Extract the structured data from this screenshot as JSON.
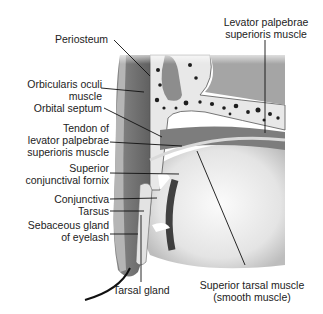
{
  "figure": {
    "labels": {
      "periosteum": "Periosteum",
      "orbicularis_1": "Orbicularis oculi",
      "orbicularis_2": "muscle",
      "orbital_septum": "Orbital septum",
      "tendon_1": "Tendon of",
      "tendon_2": "levator palpebrae",
      "tendon_3": "superioris muscle",
      "fornix_1": "Superior",
      "fornix_2": "conjunctival fornix",
      "conjunctiva": "Conjunctiva",
      "tarsus": "Tarsus",
      "sebaceous_1": "Sebaceous gland",
      "sebaceous_2": "of eyelash",
      "tarsal_gland": "Tarsal gland",
      "levator_1": "Levator palpebrae",
      "levator_2": "superioris muscle",
      "sup_tarsal_1": "Superior tarsal muscle",
      "sup_tarsal_2": "(smooth muscle)"
    },
    "colors": {
      "background": "#ffffff",
      "tissue_dark": "#6e6e6e",
      "tissue_mid": "#9a9a9a",
      "bone": "#e6e6e6",
      "eyeball": "#f2f2f2",
      "leader": "#111111"
    }
  }
}
